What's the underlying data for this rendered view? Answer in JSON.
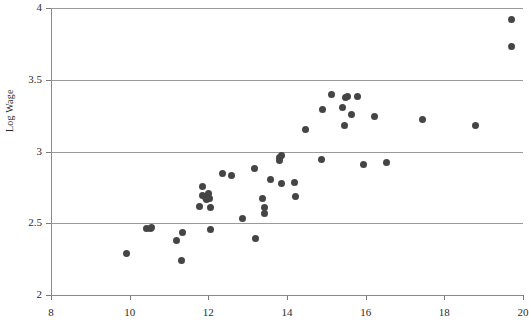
{
  "chart": {
    "type": "scatter",
    "title": "",
    "y_axis_title": "Log Wage",
    "x_axis_title": ""
  },
  "chart_data": {
    "type": "scatter",
    "title": "",
    "xlabel": "",
    "ylabel": "Log Wage",
    "xlim": [
      8,
      20
    ],
    "ylim": [
      2,
      4
    ],
    "xticks": [
      8,
      10,
      12,
      14,
      16,
      18,
      20
    ],
    "yticks": [
      2,
      2.5,
      3,
      3.5,
      4
    ],
    "xtick_labels": [
      "8",
      "10",
      "12",
      "14",
      "16",
      "18",
      "20"
    ],
    "ytick_labels": [
      "2",
      "2.5",
      "3",
      "3.5",
      "4"
    ],
    "grid": "horizontal",
    "legend": "none",
    "marker": {
      "shape": "circle",
      "color": "#454545",
      "size_px": 7
    },
    "series": [
      {
        "name": "observations",
        "points": [
          [
            9.92,
            2.29
          ],
          [
            10.44,
            2.46
          ],
          [
            10.52,
            2.465
          ],
          [
            10.56,
            2.47
          ],
          [
            11.18,
            2.38
          ],
          [
            11.35,
            2.435
          ],
          [
            11.33,
            2.24
          ],
          [
            11.78,
            2.62
          ],
          [
            11.86,
            2.755
          ],
          [
            11.84,
            2.695
          ],
          [
            11.92,
            2.68
          ],
          [
            11.95,
            2.665
          ],
          [
            12.0,
            2.71
          ],
          [
            12.02,
            2.675
          ],
          [
            12.05,
            2.61
          ],
          [
            12.05,
            2.455
          ],
          [
            12.35,
            2.845
          ],
          [
            12.6,
            2.83
          ],
          [
            12.88,
            2.535
          ],
          [
            13.18,
            2.885
          ],
          [
            13.2,
            2.395
          ],
          [
            13.38,
            2.675
          ],
          [
            13.42,
            2.61
          ],
          [
            13.42,
            2.565
          ],
          [
            13.58,
            2.805
          ],
          [
            13.82,
            2.96
          ],
          [
            13.85,
            2.975
          ],
          [
            13.8,
            2.94
          ],
          [
            13.85,
            2.775
          ],
          [
            14.18,
            2.785
          ],
          [
            14.22,
            2.685
          ],
          [
            14.48,
            3.15
          ],
          [
            14.88,
            2.945
          ],
          [
            14.9,
            3.29
          ],
          [
            15.12,
            3.4
          ],
          [
            15.42,
            3.31
          ],
          [
            15.48,
            3.375
          ],
          [
            15.55,
            3.38
          ],
          [
            15.45,
            3.18
          ],
          [
            15.65,
            3.26
          ],
          [
            15.78,
            3.385
          ],
          [
            15.95,
            2.91
          ],
          [
            16.22,
            3.245
          ],
          [
            16.52,
            2.925
          ],
          [
            17.45,
            3.225
          ],
          [
            18.78,
            3.18
          ],
          [
            19.7,
            3.92
          ],
          [
            19.7,
            3.73
          ]
        ]
      }
    ]
  }
}
